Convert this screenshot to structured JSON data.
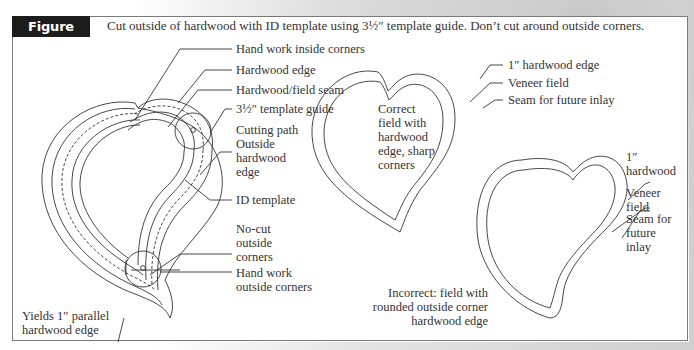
{
  "figure": {
    "number_label": "Figure 4.63",
    "caption": "Cut outside of hardwood with ID template using 3½″ template guide. Don’t cut around outside corners."
  },
  "left_diagram": {
    "callouts": [
      {
        "id": "hand-work-inside-corners",
        "text": "Hand work inside corners"
      },
      {
        "id": "hardwood-edge",
        "text": "Hardwood edge"
      },
      {
        "id": "hardwood-field-seam",
        "text": "Hardwood/field seam"
      },
      {
        "id": "template-guide",
        "text": "3½″ template guide"
      },
      {
        "id": "cutting-path",
        "lines": [
          "Cutting path",
          "Outside",
          "hardwood",
          "edge"
        ]
      },
      {
        "id": "id-template",
        "text": "ID template"
      },
      {
        "id": "no-cut-outside-corners",
        "lines": [
          "No-cut",
          "outside",
          "corners"
        ]
      },
      {
        "id": "hand-work-outside-corners",
        "lines": [
          "Hand work",
          "outside corners"
        ]
      },
      {
        "id": "yields-parallel-edge",
        "lines": [
          "Yields 1″ parallel",
          "hardwood edge"
        ]
      }
    ]
  },
  "correct_diagram": {
    "callouts": [
      {
        "id": "hardwood-edge-1in",
        "text": "1″ hardwood edge"
      },
      {
        "id": "veneer-field",
        "text": "Veneer field"
      },
      {
        "id": "seam-future-inlay",
        "text": "Seam for future inlay"
      }
    ],
    "inner_note": [
      "Correct",
      "field with",
      "hardwood",
      "edge, sharp",
      "corners"
    ]
  },
  "incorrect_diagram": {
    "callouts": [
      {
        "id": "hardwood-1in",
        "lines": [
          "1″",
          "hardwood"
        ]
      },
      {
        "id": "veneer-field",
        "lines": [
          "Veneer",
          "field"
        ]
      },
      {
        "id": "seam-future-inlay",
        "lines": [
          "Seam for",
          "future",
          "inlay"
        ]
      }
    ],
    "note": [
      "Incorrect: field with",
      "rounded outside corner",
      "hardwood edge"
    ]
  },
  "colors": {
    "label_bg": "#1c1c1c",
    "line": "#333333",
    "frame": "#7a7a7a"
  }
}
